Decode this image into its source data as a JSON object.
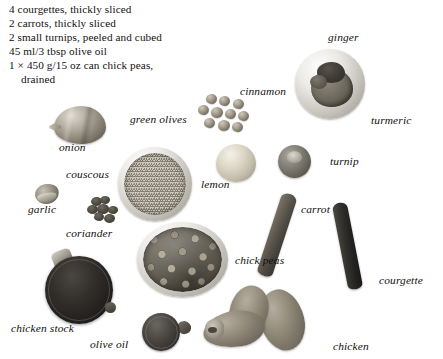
{
  "page": {
    "width": 443,
    "height": 359,
    "background_color": "#ffffff",
    "text_color": "#14120f"
  },
  "ingredients": {
    "name": "ingredient-list",
    "lines": [
      "4 courgettes, thickly sliced",
      "2 carrots, thickly sliced",
      "2 small turnips, peeled and cubed",
      "45 ml/3 tbsp olive oil",
      "1 × 450 g/15 oz can chick peas,",
      "drained"
    ]
  },
  "labels": {
    "onion": "onion",
    "green_olives": "green olives",
    "couscous": "couscous",
    "garlic": "garlic",
    "coriander": "coriander",
    "cinnamon": "cinnamon",
    "ginger": "ginger",
    "turmeric": "turmeric",
    "lemon": "lemon",
    "turnip": "turnip",
    "carrot": "carrot",
    "chick_peas": "chick peas",
    "courgette": "courgette",
    "chicken_stock": "chicken stock",
    "olive_oil": "olive oil",
    "chicken": "chicken"
  }
}
